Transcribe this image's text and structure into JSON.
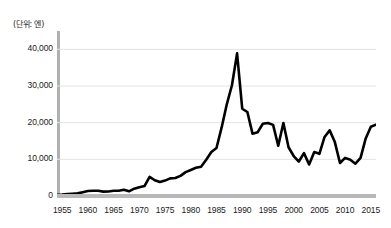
{
  "chart_data": {
    "type": "line",
    "title": "",
    "subtitle": "",
    "unit_label": "(단위: 엔)",
    "xlabel": "",
    "ylabel": "",
    "xlim": [
      1954,
      2016
    ],
    "ylim": [
      0,
      45000
    ],
    "grid": true,
    "grid_axis": "y",
    "legend": false,
    "legend_position": "none",
    "line_color": "#000000",
    "grid_color": "#e3e3e3",
    "axis_color": "#b8b8b8",
    "background_color": "#ffffff",
    "ytick_labels": [
      "0",
      "10,000",
      "20,000",
      "30,000",
      "40,000"
    ],
    "ytick_values": [
      0,
      10000,
      20000,
      30000,
      40000
    ],
    "xtick_labels": [
      "1955",
      "1960",
      "1965",
      "1970",
      "1975",
      "1980",
      "1985",
      "1990",
      "1995",
      "2000",
      "2005",
      "2010",
      "2015"
    ],
    "xtick_values": [
      1955,
      1960,
      1965,
      1970,
      1975,
      1980,
      1985,
      1990,
      1995,
      2000,
      2005,
      2010,
      2015
    ],
    "series": [
      {
        "name": "Nikkei 225",
        "x": [
          1954,
          1955,
          1956,
          1957,
          1958,
          1959,
          1960,
          1961,
          1962,
          1963,
          1964,
          1965,
          1966,
          1967,
          1968,
          1969,
          1970,
          1971,
          1972,
          1973,
          1974,
          1975,
          1976,
          1977,
          1978,
          1979,
          1980,
          1981,
          1982,
          1983,
          1984,
          1985,
          1986,
          1987,
          1988,
          1989,
          1990,
          1991,
          1992,
          1993,
          1994,
          1995,
          1996,
          1997,
          1998,
          1999,
          2000,
          2001,
          2002,
          2003,
          2004,
          2005,
          2006,
          2007,
          2008,
          2009,
          2010,
          2011,
          2012,
          2013,
          2014,
          2015,
          2016
        ],
        "values": [
          350,
          420,
          560,
          630,
          720,
          1050,
          1350,
          1430,
          1420,
          1200,
          1220,
          1420,
          1450,
          1700,
          1280,
          2000,
          2400,
          2700,
          5200,
          4300,
          3800,
          4200,
          4800,
          4900,
          5500,
          6500,
          7100,
          7700,
          8000,
          9900,
          12000,
          13100,
          18700,
          25000,
          30200,
          38900,
          23800,
          22900,
          17000,
          17400,
          19700,
          19900,
          19400,
          13700,
          19900,
          13300,
          10900,
          9400,
          11700,
          8600,
          12000,
          11500,
          16100,
          17900,
          14700,
          9000,
          10400,
          9900,
          8800,
          10400,
          15700,
          18900,
          19450
        ],
        "peak": {
          "year": 1989,
          "value": 38900
        },
        "last": {
          "year": 2016,
          "value": 19450
        }
      }
    ]
  }
}
